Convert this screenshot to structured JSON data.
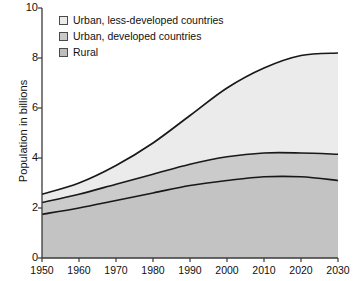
{
  "chart_data": {
    "type": "area",
    "stacked": true,
    "title": "",
    "subtitle": "",
    "xlabel": "",
    "ylabel": "Population in billions",
    "xlim": [
      1950,
      2030
    ],
    "ylim": [
      0,
      10
    ],
    "grid": false,
    "legend_position": "top-left",
    "x": [
      1950,
      1960,
      1970,
      1980,
      1990,
      2000,
      2010,
      2020,
      2030
    ],
    "xtick_labels": [
      "1950",
      "1960",
      "1970",
      "1980",
      "1990",
      "2000",
      "2010",
      "2020",
      "2030"
    ],
    "ytick_labels": [
      "0",
      "2",
      "4",
      "6",
      "8",
      "10"
    ],
    "ytick_values": [
      0,
      2,
      4,
      6,
      8,
      10
    ],
    "series": [
      {
        "name": "Rural",
        "color": "#c3c3c3",
        "values": [
          1.75,
          2.0,
          2.3,
          2.6,
          2.9,
          3.1,
          3.25,
          3.25,
          3.1
        ]
      },
      {
        "name": "Urban, developed countries",
        "color": "#cbcbcb",
        "values": [
          0.47,
          0.55,
          0.65,
          0.75,
          0.85,
          0.95,
          0.95,
          0.95,
          1.05
        ]
      },
      {
        "name": "Urban, less-developed countries",
        "color": "#ebebeb",
        "values": [
          0.33,
          0.45,
          0.75,
          1.25,
          1.95,
          2.75,
          3.4,
          3.9,
          4.05
        ]
      }
    ],
    "cumulative_totals": {
      "rural": [
        1.75,
        2.0,
        2.3,
        2.6,
        2.9,
        3.1,
        3.25,
        3.25,
        3.1
      ],
      "rural_plus_urban_developed": [
        2.22,
        2.55,
        2.95,
        3.35,
        3.75,
        4.05,
        4.2,
        4.2,
        4.15
      ],
      "total": [
        2.55,
        3.0,
        3.7,
        4.6,
        5.7,
        6.8,
        7.6,
        8.1,
        8.2
      ]
    },
    "legend": [
      {
        "label": "Urban, less-developed countries",
        "color": "#ebebeb"
      },
      {
        "label": "Urban, developed countries",
        "color": "#c9c9c9"
      },
      {
        "label": "Rural",
        "color": "#bdbdbd"
      }
    ]
  },
  "axis": {
    "y_title": "Population in billions"
  },
  "colors": {
    "axis_line": "#3a3a3a",
    "curve_line": "#181818",
    "text": "#101010",
    "band_top": "#ebebeb",
    "band_middle": "#cbcbcb",
    "band_bottom": "#c3c3c3",
    "legend_swatch_border": "#4a4a4a"
  }
}
